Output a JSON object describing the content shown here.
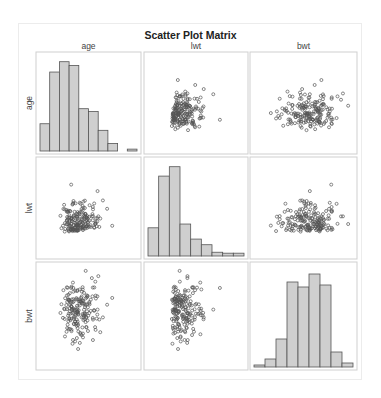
{
  "chart_data": {
    "type": "scatter_matrix",
    "title": "Scatter Plot Matrix",
    "variables": [
      "age",
      "lwt",
      "bwt"
    ],
    "layout": {
      "grid": false,
      "legend": "none",
      "diagonal": "histogram",
      "off_diagonal": "scatter"
    },
    "histograms": {
      "age": {
        "relative_heights": [
          0.29,
          0.84,
          0.95,
          0.91,
          0.45,
          0.42,
          0.22,
          0.08,
          0.0,
          0.02
        ]
      },
      "lwt": {
        "relative_heights": [
          0.3,
          0.85,
          0.95,
          0.34,
          0.18,
          0.12,
          0.04,
          0.03,
          0.03
        ]
      },
      "bwt": {
        "relative_heights": [
          0.02,
          0.08,
          0.28,
          0.85,
          0.8,
          0.93,
          0.82,
          0.15,
          0.04
        ]
      }
    },
    "correlation_shape": {
      "age_vs_lwt": "weak positive, cluster lower-left",
      "age_vs_bwt": "no clear trend, central cloud",
      "lwt_vs_bwt": "weak positive, cluster lower-left"
    }
  },
  "colors": {
    "bar_fill": "#cfcfcf",
    "bar_stroke": "#555555",
    "point_stroke": "#555555",
    "panel_border": "#cfcfcf",
    "frame_border": "#ececec"
  }
}
